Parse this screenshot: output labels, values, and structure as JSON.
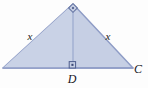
{
  "figure": {
    "type": "geometry-diagram",
    "background_color": "#fdfdfd",
    "fill_color": "#c6cfe4",
    "stroke_color": "#8e9cc6",
    "altitude_color": "#aab6d6",
    "label_color": "#1b1b22"
  },
  "triangle": {
    "apex": {
      "x": 73,
      "y": 4
    },
    "left_vertex": {
      "x": 3,
      "y": 68
    },
    "right_vertex": {
      "x": 133,
      "y": 68
    },
    "foot": {
      "x": 73,
      "y": 68
    }
  },
  "labels": {
    "left_leg": "x",
    "right_leg": "x",
    "foot_point": "D",
    "right_vertex": "C"
  },
  "marks": {
    "apex_right_angle": "right-angle-square",
    "foot_right_angle": "right-angle-square"
  }
}
